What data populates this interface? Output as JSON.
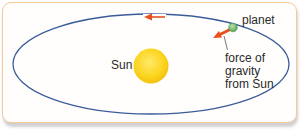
{
  "diagram": {
    "labels": {
      "sun": "Sun",
      "planet": "planet",
      "force_line1": "force of",
      "force_line2": "gravity",
      "force_line3": "from Sun"
    },
    "colors": {
      "frame_border": "#f5c79a",
      "orbit": "#3a5c9a",
      "sun": "#f7c81e",
      "planet": "#7cc17a",
      "arrow": "#e8501e"
    }
  }
}
